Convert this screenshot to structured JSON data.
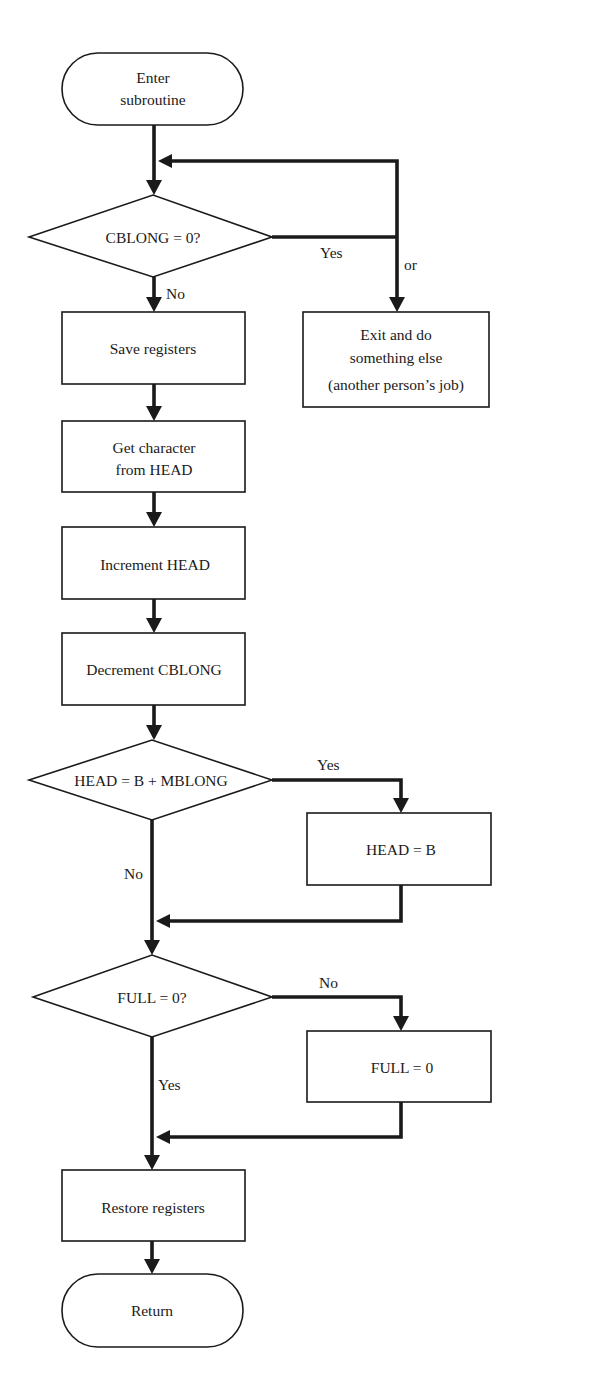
{
  "diagram": {
    "type": "flowchart",
    "nodes": {
      "start": {
        "line1": "Enter",
        "line2": "subroutine"
      },
      "decision_cblong": {
        "label": "CBLONG = 0?"
      },
      "exit_box": {
        "line1": "Exit and do",
        "line2": "something else",
        "line3": "(another person’s job)"
      },
      "save_registers": {
        "label": "Save registers"
      },
      "get_character": {
        "line1": "Get character",
        "line2": "from HEAD"
      },
      "increment_head": {
        "label": "Increment HEAD"
      },
      "decrement_cblong": {
        "label": "Decrement CBLONG"
      },
      "decision_head": {
        "label": "HEAD = B + MBLONG"
      },
      "head_equals_b": {
        "label": "HEAD = B"
      },
      "decision_full": {
        "label": "FULL = 0?"
      },
      "full_equals_0": {
        "label": "FULL = 0"
      },
      "restore_registers": {
        "label": "Restore registers"
      },
      "return": {
        "label": "Return"
      }
    },
    "edge_labels": {
      "cblong_yes": "Yes",
      "cblong_or": "or",
      "cblong_no": "No",
      "head_yes": "Yes",
      "head_no": "No",
      "full_no": "No",
      "full_yes": "Yes"
    },
    "edges": [
      {
        "from": "start",
        "to": "decision_cblong"
      },
      {
        "from": "decision_cblong",
        "to": "decision_cblong",
        "label": "Yes",
        "note": "loop back (wait)"
      },
      {
        "from": "decision_cblong",
        "to": "exit_box",
        "label": "or"
      },
      {
        "from": "decision_cblong",
        "to": "save_registers",
        "label": "No"
      },
      {
        "from": "save_registers",
        "to": "get_character"
      },
      {
        "from": "get_character",
        "to": "increment_head"
      },
      {
        "from": "increment_head",
        "to": "decrement_cblong"
      },
      {
        "from": "decrement_cblong",
        "to": "decision_head"
      },
      {
        "from": "decision_head",
        "to": "head_equals_b",
        "label": "Yes"
      },
      {
        "from": "decision_head",
        "to": "decision_full",
        "label": "No"
      },
      {
        "from": "head_equals_b",
        "to": "decision_full"
      },
      {
        "from": "decision_full",
        "to": "full_equals_0",
        "label": "No"
      },
      {
        "from": "decision_full",
        "to": "restore_registers",
        "label": "Yes"
      },
      {
        "from": "full_equals_0",
        "to": "restore_registers"
      },
      {
        "from": "restore_registers",
        "to": "return"
      }
    ],
    "colors": {
      "ink": "#1a1a1a",
      "background": "#ffffff"
    }
  }
}
